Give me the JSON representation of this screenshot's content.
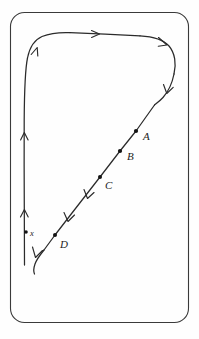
{
  "figure": {
    "background_color": "#fefefe",
    "ink_color": "#2b2b2b",
    "frame": {
      "shape": "rounded-rectangle",
      "x": 10,
      "y": 12,
      "width": 178,
      "height": 310,
      "corner_radius": 14,
      "stroke_color": "#3a3a3a"
    },
    "points": [
      {
        "id": "A",
        "label": "A",
        "dot_x": 136,
        "dot_y": 131,
        "label_x": 143,
        "label_y": 140
      },
      {
        "id": "B",
        "label": "B",
        "dot_x": 120,
        "dot_y": 151,
        "label_x": 127,
        "label_y": 160
      },
      {
        "id": "C",
        "label": "C",
        "dot_x": 100,
        "dot_y": 177,
        "label_x": 105,
        "label_y": 189
      },
      {
        "id": "D",
        "label": "D",
        "dot_x": 55,
        "dot_y": 235,
        "label_x": 60,
        "label_y": 248
      },
      {
        "id": "x",
        "label": "x",
        "dot_x": 26,
        "dot_y": 232,
        "label_x": 30,
        "label_y": 236
      }
    ],
    "arrow_count": 11,
    "path_description": "closed loop: up the left vertical, curve right across the top, curve down the right side, then straight diagonal down-left through A, B, C, D to the lower-left"
  }
}
